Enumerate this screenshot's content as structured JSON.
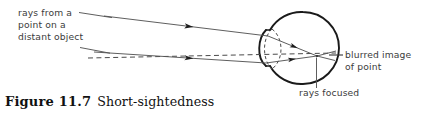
{
  "figure": {
    "caption_label": "Figure 11.7",
    "caption_text": "Short-sightedness",
    "width": 423,
    "height": 116
  },
  "colors": {
    "ink": "#111111",
    "outline": "#1a1a1a",
    "ray": "#555555",
    "dashed": "#4a4a4a",
    "label_text": "#3b3b3b",
    "background": "#ffffff"
  },
  "annotations": {
    "source_label": {
      "lines": [
        "rays from a",
        "point on a",
        "distant object"
      ],
      "x": 18,
      "y": 16
    },
    "image_label": {
      "lines": [
        "blurred image",
        "of point"
      ],
      "x": 344,
      "y": 54
    },
    "focus_label": {
      "lines": [
        "rays focused"
      ],
      "x": 299,
      "y": 98
    }
  },
  "diagram": {
    "type": "optics-ray-diagram",
    "eye": {
      "shape": "circle",
      "center_x": 303,
      "center_y": 48,
      "radius": 36
    },
    "lens": {
      "shape": "dashed-ellipse",
      "center_x": 276,
      "center_y": 49,
      "rx": 11,
      "ry": 21
    },
    "rays": [
      {
        "name": "upper-ray",
        "from_x": 104,
        "from_y": 16,
        "to_x": 268,
        "to_y": 36,
        "arrow_at_x": 185,
        "arrow_at_y": 24
      },
      {
        "name": "lower-ray",
        "from_x": 94,
        "from_y": 52,
        "to_x": 266,
        "to_y": 63,
        "arrow_at_x": 186,
        "arrow_at_y": 58
      }
    ],
    "refracted_rays": [
      {
        "name": "upper-refracted",
        "from_x": 268,
        "from_y": 36,
        "to_x": 316,
        "to_y": 56,
        "arrow_at_x": 288,
        "arrow_at_y": 44
      },
      {
        "name": "lower-refracted",
        "from_x": 266,
        "from_y": 63,
        "to_x": 316,
        "to_y": 56,
        "arrow_at_x": 286,
        "arrow_at_y": 61
      }
    ],
    "blur_spread": [
      {
        "name": "upper-blur",
        "from_x": 316,
        "from_y": 56,
        "to_x": 335,
        "to_y": 51
      },
      {
        "name": "lower-blur",
        "from_x": 316,
        "from_y": 56,
        "to_x": 334,
        "to_y": 60
      }
    ],
    "axis": {
      "name": "principal-axis",
      "style": "dashed",
      "from_x": 88,
      "from_y": 58,
      "to_x": 336,
      "to_y": 53
    },
    "focal_point": {
      "x": 316,
      "y": 56
    },
    "leaders": [
      {
        "name": "source-leader-upper",
        "from_x": 78,
        "from_y": 13,
        "to_x": 110,
        "to_y": 17
      },
      {
        "name": "source-leader-lower",
        "from_x": 80,
        "from_y": 48,
        "to_x": 110,
        "to_y": 54
      },
      {
        "name": "image-leader",
        "from_x": 329,
        "from_y": 55,
        "to_x": 343,
        "to_y": 55
      },
      {
        "name": "focus-leader",
        "from_x": 316,
        "from_y": 58,
        "to_x": 316,
        "to_y": 88
      }
    ]
  }
}
